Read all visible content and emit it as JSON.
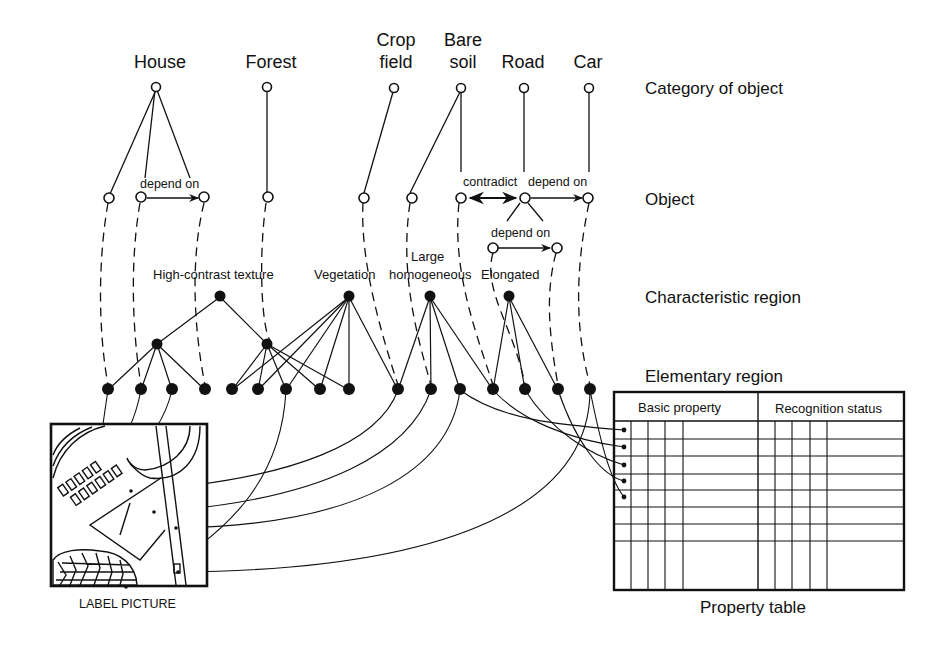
{
  "categories": [
    {
      "label": "House"
    },
    {
      "label": "Forest"
    },
    {
      "label": "Crop\nfield",
      "line1": "Crop",
      "line2": "field"
    },
    {
      "label": "Bare\nsoil",
      "line1": "Bare",
      "line2": "soil"
    },
    {
      "label": "Road"
    },
    {
      "label": "Car"
    }
  ],
  "levels": {
    "category": "Category of object",
    "object": "Object",
    "characteristic": "Characteristic region",
    "elementary": "Elementary region"
  },
  "relations": {
    "house_depend": "depend on",
    "contradict": "contradict",
    "road_car_depend": "depend on",
    "road_sub_depend": "depend on"
  },
  "characteristic_regions": {
    "texture": "High-contrast texture",
    "vegetation": "Vegetation",
    "large_line1": "Large",
    "large_line2": "homogeneous",
    "elongated": "Elongated"
  },
  "property_table": {
    "col1_header": "Basic property",
    "col2_header": "Recognition status",
    "caption": "Property table"
  },
  "label_picture": {
    "caption": "LABEL PICTURE"
  }
}
